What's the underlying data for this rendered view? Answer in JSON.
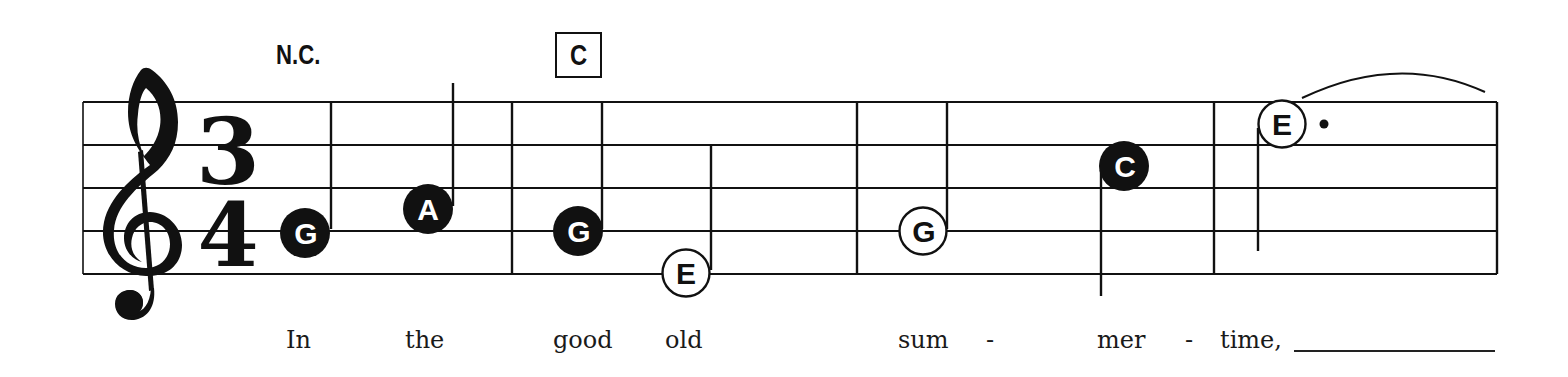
{
  "score": {
    "clef": "treble",
    "clef_icon": "treble-clef-icon",
    "time_signature": {
      "numerator": "3",
      "denominator": "4"
    },
    "chords": [
      {
        "label": "N.C.",
        "boxed": false
      },
      {
        "label": "C",
        "boxed": true
      }
    ],
    "measures": [
      {
        "number": 1,
        "notes": [
          {
            "letter": "G",
            "type": "quarter",
            "filled": true
          },
          {
            "letter": "A",
            "type": "quarter",
            "filled": true
          }
        ]
      },
      {
        "number": 2,
        "notes": [
          {
            "letter": "G",
            "type": "quarter",
            "filled": true
          },
          {
            "letter": "E",
            "type": "half",
            "filled": false
          }
        ]
      },
      {
        "number": 3,
        "notes": [
          {
            "letter": "G",
            "type": "half",
            "filled": false
          },
          {
            "letter": "C",
            "type": "quarter",
            "filled": true
          }
        ]
      },
      {
        "number": 4,
        "notes": [
          {
            "letter": "E",
            "type": "dotted-half",
            "filled": false,
            "tied": true
          }
        ]
      }
    ],
    "lyrics": [
      {
        "text": "In"
      },
      {
        "text": "the"
      },
      {
        "text": "good"
      },
      {
        "text": "old"
      },
      {
        "text": "sum"
      },
      {
        "text": "-"
      },
      {
        "text": "mer"
      },
      {
        "text": "-"
      },
      {
        "text": "time,"
      }
    ],
    "colors": {
      "ink": "#111111",
      "paper": "#ffffff"
    }
  }
}
